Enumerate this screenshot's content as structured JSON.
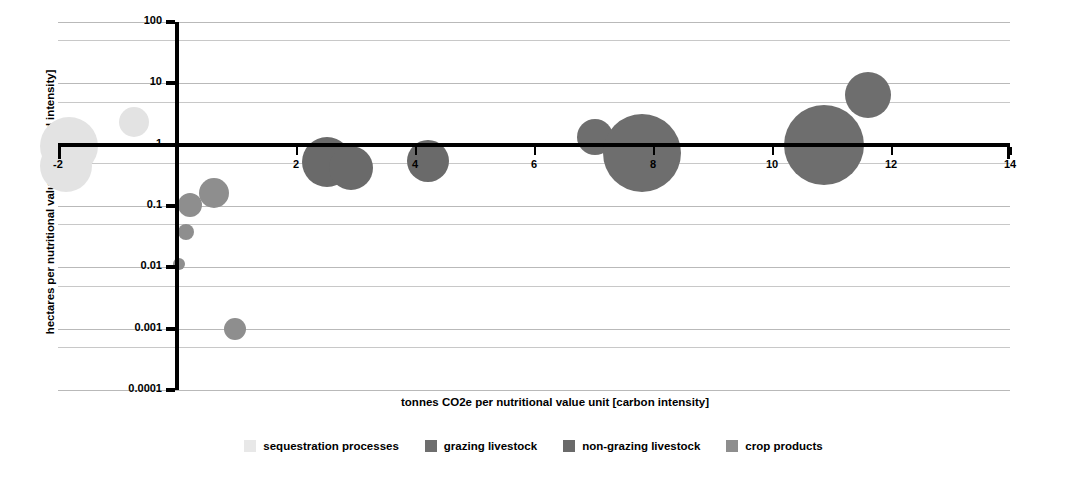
{
  "chart_data": {
    "type": "scatter",
    "title": "",
    "xlabel": "tonnes CO2e per nutritional value unit [carbon intensity]",
    "ylabel": "hectares per nutritional value unit [land intensity]",
    "xscale": "linear",
    "yscale": "log",
    "xlim": [
      -2,
      14
    ],
    "ylim": [
      0.0001,
      100
    ],
    "xticks": [
      -2,
      0,
      2,
      4,
      6,
      8,
      10,
      12,
      14
    ],
    "xticklabels": [
      "-2",
      "",
      "2",
      "4",
      "6",
      "8",
      "10",
      "12",
      "14"
    ],
    "yticks": [
      100,
      10,
      1,
      0.1,
      0.01,
      0.001,
      0.0001
    ],
    "yticklabels": [
      "100",
      "10",
      "1",
      "0.1",
      "0.01",
      "0.001",
      "0.0001"
    ],
    "grid": true,
    "grid_minor": true,
    "legend_position": "bottom",
    "xaxis_crosses_y_at": 1,
    "series": [
      {
        "name": "sequestration processes",
        "color": "#e3e3e3",
        "points": [
          {
            "x": -1.82,
            "y": 0.95,
            "r": 29
          },
          {
            "x": -1.86,
            "y": 0.45,
            "r": 26
          },
          {
            "x": -0.72,
            "y": 2.3,
            "r": 15
          }
        ]
      },
      {
        "name": "grazing livestock",
        "color": "#6e6e6e",
        "points": [
          {
            "x": 7.02,
            "y": 1.35,
            "r": 18
          },
          {
            "x": 7.82,
            "y": 0.72,
            "r": 39
          },
          {
            "x": 10.88,
            "y": 1.0,
            "r": 40
          },
          {
            "x": 11.62,
            "y": 6.5,
            "r": 23
          }
        ]
      },
      {
        "name": "non-grazing livestock",
        "color": "#6a6a6a",
        "points": [
          {
            "x": 2.52,
            "y": 0.52,
            "r": 25
          },
          {
            "x": 2.92,
            "y": 0.42,
            "r": 22
          },
          {
            "x": 4.22,
            "y": 0.55,
            "r": 21
          }
        ]
      },
      {
        "name": "crop products",
        "color": "#8e8e8e",
        "points": [
          {
            "x": 0.62,
            "y": 0.165,
            "r": 15
          },
          {
            "x": 0.22,
            "y": 0.105,
            "r": 12
          },
          {
            "x": 0.15,
            "y": 0.038,
            "r": 8
          },
          {
            "x": 0.04,
            "y": 0.0115,
            "r": 6
          },
          {
            "x": 0.98,
            "y": 0.001,
            "r": 11
          }
        ]
      }
    ]
  },
  "legend": {
    "items": [
      {
        "label": "sequestration processes",
        "color": "#e8e8e8"
      },
      {
        "label": "grazing livestock",
        "color": "#6e6e6e"
      },
      {
        "label": "non-grazing livestock",
        "color": "#6a6a6a"
      },
      {
        "label": "crop products",
        "color": "#8e8e8e"
      }
    ]
  }
}
